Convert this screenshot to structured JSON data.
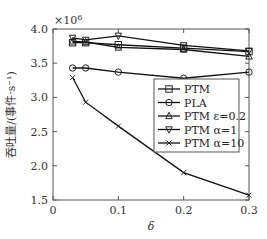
{
  "chart_data": {
    "type": "line",
    "title": "",
    "xlabel": "δ",
    "ylabel": "吞吐量/(事件·s⁻¹)",
    "y_multiplier": "×10⁶",
    "xlim": [
      0,
      0.3
    ],
    "ylim": [
      1.5,
      4.0
    ],
    "xticks": [
      "0",
      "0.1",
      "0.2",
      "0.3"
    ],
    "yticks": [
      "1.5",
      "2.0",
      "2.5",
      "3.0",
      "3.5",
      "4.0"
    ],
    "grid": false,
    "legend_position": "center-right",
    "x": [
      0.03,
      0.05,
      0.1,
      0.2,
      0.3
    ],
    "series": [
      {
        "name": "PTM",
        "marker": "square",
        "values": [
          3.8,
          3.8,
          3.77,
          3.72,
          3.67
        ]
      },
      {
        "name": "PLA",
        "marker": "circle",
        "values": [
          3.43,
          3.43,
          3.37,
          3.28,
          3.37
        ]
      },
      {
        "name": "PTM ε=0.2",
        "marker": "triangle-up",
        "values": [
          3.82,
          3.81,
          3.73,
          3.7,
          3.6
        ]
      },
      {
        "name": "PTM α=1",
        "marker": "triangle-down",
        "values": [
          3.87,
          3.84,
          3.9,
          3.76,
          3.68
        ]
      },
      {
        "name": "PTM α=10",
        "marker": "x",
        "values": [
          3.29,
          2.93,
          2.58,
          1.9,
          1.57
        ]
      }
    ]
  },
  "labels": {
    "multiplier": "×10",
    "multiplier_exp": "6",
    "xlabel": "δ",
    "ylabel": "吞吐量/(事件·s⁻¹)"
  },
  "legend": [
    "PTM",
    "PLA",
    "PTM ε=0.2",
    "PTM α=1",
    "PTM α=10"
  ]
}
